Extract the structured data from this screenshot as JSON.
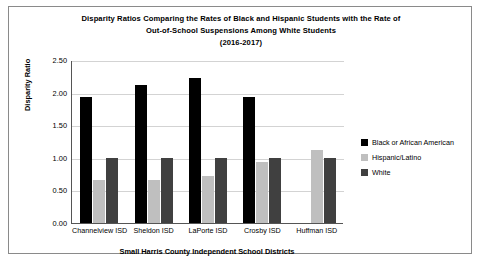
{
  "chart_data": {
    "type": "bar",
    "title": "Disparity Ratios Comparing the Rates of Black and Hispanic Students with the Rate of Out-of-School Suspensions Among White Students (2016-2017)",
    "title_lines": [
      "Disparity Ratios Comparing the Rates of Black and Hispanic Students with the Rate of",
      "Out-of-School Suspensions Among White Students",
      "(2016-2017)"
    ],
    "xlabel": "Small Harris County Independent School Districts",
    "ylabel": "Disparity Ratio",
    "ylim": [
      0.0,
      2.5
    ],
    "ytick_labels": [
      "0.00",
      "0.50",
      "1.00",
      "1.50",
      "2.00",
      "2.50"
    ],
    "yticks": [
      0.0,
      0.5,
      1.0,
      1.5,
      2.0,
      2.5
    ],
    "grid": true,
    "legend_position": "right",
    "categories": [
      "Channelview ISD",
      "Sheldon ISD",
      "LaPorte ISD",
      "Crosby ISD",
      "Huffman ISD"
    ],
    "series": [
      {
        "name": "Black or African American",
        "color": "#000000",
        "values": [
          1.93,
          2.12,
          2.22,
          1.94,
          0.0
        ]
      },
      {
        "name": "Hispanic/Latino",
        "color": "#bfbfbf",
        "values": [
          0.66,
          0.66,
          0.72,
          0.94,
          1.12
        ]
      },
      {
        "name": "White",
        "color": "#404040",
        "values": [
          1.0,
          1.0,
          1.0,
          1.0,
          1.0
        ]
      }
    ]
  }
}
